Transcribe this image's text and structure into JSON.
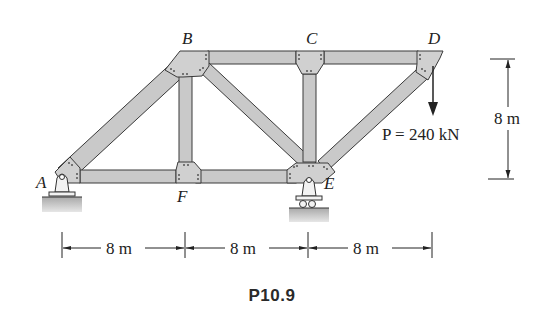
{
  "figure": {
    "caption": "P10.9",
    "joints": {
      "A": "A",
      "B": "B",
      "C": "C",
      "D": "D",
      "E": "E",
      "F": "F"
    },
    "load": {
      "label": "P = 240 kN",
      "symbol": "P",
      "value": "240",
      "unit": "kN",
      "direction": "down",
      "applied_at": "D"
    },
    "dimensions": {
      "horizontal": [
        "8 m",
        "8 m",
        "8 m"
      ],
      "vertical": "8 m"
    },
    "supports": {
      "A": "pin",
      "E": "roller"
    },
    "members": [
      "AB",
      "AF",
      "BF",
      "BC",
      "BE",
      "CE",
      "CD",
      "DE",
      "EF"
    ],
    "colors": {
      "member_fill": "#c9c9c9",
      "member_stroke": "#3a3a3a",
      "gusset_fill": "#d0d0d0",
      "ground_fill": "#b5b5b5",
      "ink": "#222222"
    }
  }
}
